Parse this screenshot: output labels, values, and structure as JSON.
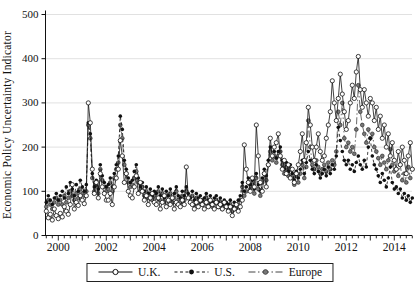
{
  "figure": {
    "background_color": "#ffffff",
    "text_color": "#111111",
    "grid_color": "#d9d9d9",
    "axis_color": "#111111"
  },
  "chart_data": {
    "type": "line",
    "title": "",
    "xlabel": "",
    "ylabel": "Economic Policy Uncertainty Indicator",
    "ylim": [
      0,
      500
    ],
    "yticks": [
      0,
      100,
      200,
      300,
      400,
      500
    ],
    "xticks": [
      2000,
      2002,
      2004,
      2006,
      2008,
      2010,
      2012,
      2014
    ],
    "x_minor_tick_interval_years": 0.25,
    "x_start": 1999.5,
    "x_step_years": 0.0833,
    "xlim": [
      1999.4,
      2014.85
    ],
    "grid": "horizontal",
    "legend_position": "bottom-center",
    "frequency": "monthly",
    "series": [
      {
        "name": "U.K.",
        "line": "solid",
        "marker": "open-circle",
        "color": "#111111",
        "values": [
          55,
          40,
          48,
          35,
          60,
          45,
          38,
          50,
          42,
          65,
          55,
          48,
          70,
          115,
          60,
          75,
          68,
          90,
          80,
          72,
          90,
          300,
          255,
          150,
          95,
          120,
          85,
          140,
          110,
          95,
          80,
          80,
          95,
          70,
          110,
          130,
          150,
          215,
          180,
          120,
          140,
          100,
          90,
          85,
          110,
          135,
          95,
          120,
          100,
          80,
          90,
          70,
          85,
          95,
          75,
          70,
          85,
          60,
          75,
          90,
          65,
          80,
          70,
          85,
          60,
          75,
          70,
          65,
          80,
          70,
          155,
          85,
          75,
          70,
          60,
          75,
          65,
          80,
          70,
          60,
          75,
          65,
          80,
          70,
          60,
          75,
          65,
          70,
          60,
          75,
          65,
          55,
          65,
          45,
          60,
          70,
          55,
          65,
          80,
          205,
          150,
          120,
          100,
          130,
          110,
          250,
          180,
          120,
          100,
          140,
          110,
          160,
          220,
          180,
          200,
          210,
          230,
          180,
          150,
          170,
          140,
          160,
          130,
          150,
          120,
          140,
          160,
          190,
          230,
          170,
          210,
          290,
          250,
          200,
          170,
          200,
          230,
          190,
          170,
          180,
          220,
          250,
          280,
          350,
          300,
          260,
          310,
          365,
          320,
          280,
          240,
          260,
          300,
          340,
          310,
          370,
          405,
          330,
          290,
          330,
          300,
          270,
          310,
          300,
          260,
          290,
          240,
          270,
          220,
          250,
          200,
          230,
          180,
          210,
          170,
          150,
          190,
          160,
          200,
          170,
          140,
          180,
          210,
          150
        ]
      },
      {
        "name": "U.S.",
        "line": "dashed",
        "marker": "filled-circle",
        "color": "#111111",
        "values": [
          75,
          90,
          80,
          70,
          85,
          95,
          80,
          90,
          100,
          85,
          110,
          95,
          120,
          105,
          90,
          115,
          100,
          125,
          110,
          100,
          115,
          255,
          230,
          140,
          110,
          125,
          105,
          160,
          135,
          120,
          110,
          115,
          130,
          110,
          140,
          160,
          180,
          270,
          240,
          170,
          150,
          130,
          120,
          125,
          145,
          160,
          130,
          110,
          120,
          100,
          110,
          95,
          105,
          90,
          100,
          95,
          110,
          90,
          105,
          85,
          100,
          90,
          105,
          85,
          95,
          110,
          90,
          85,
          100,
          90,
          110,
          95,
          85,
          100,
          80,
          95,
          85,
          90,
          80,
          85,
          95,
          80,
          90,
          75,
          85,
          90,
          75,
          85,
          70,
          80,
          75,
          70,
          80,
          65,
          75,
          70,
          80,
          90,
          120,
          100,
          110,
          130,
          115,
          125,
          105,
          140,
          115,
          100,
          130,
          150,
          135,
          170,
          200,
          180,
          190,
          175,
          190,
          200,
          170,
          150,
          165,
          145,
          160,
          140,
          125,
          145,
          130,
          150,
          170,
          140,
          165,
          190,
          170,
          150,
          140,
          160,
          145,
          130,
          140,
          150,
          135,
          155,
          140,
          160,
          150,
          180,
          245,
          215,
          190,
          170,
          160,
          170,
          150,
          160,
          145,
          165,
          180,
          160,
          150,
          170,
          155,
          200,
          220,
          180,
          160,
          150,
          135,
          120,
          140,
          125,
          110,
          130,
          155,
          120,
          105,
          110,
          95,
          105,
          85,
          95,
          80,
          90,
          75,
          85
        ]
      },
      {
        "name": "Europe",
        "line": "dash-dot",
        "marker": "gray-circle",
        "color": "#444444",
        "values": [
          65,
          80,
          70,
          60,
          75,
          85,
          70,
          80,
          70,
          90,
          75,
          85,
          100,
          90,
          80,
          95,
          85,
          105,
          95,
          90,
          100,
          250,
          220,
          130,
          100,
          115,
          95,
          150,
          125,
          110,
          100,
          105,
          120,
          100,
          130,
          150,
          165,
          250,
          220,
          160,
          140,
          120,
          110,
          115,
          130,
          145,
          120,
          100,
          110,
          90,
          100,
          85,
          95,
          80,
          90,
          85,
          100,
          80,
          95,
          75,
          90,
          80,
          95,
          75,
          85,
          100,
          80,
          75,
          90,
          80,
          100,
          85,
          75,
          90,
          70,
          85,
          75,
          80,
          70,
          75,
          85,
          70,
          80,
          65,
          75,
          80,
          65,
          75,
          60,
          70,
          65,
          60,
          70,
          55,
          65,
          60,
          70,
          80,
          110,
          90,
          100,
          120,
          105,
          115,
          95,
          130,
          105,
          90,
          120,
          140,
          125,
          160,
          190,
          170,
          180,
          165,
          180,
          190,
          160,
          140,
          155,
          135,
          150,
          130,
          115,
          135,
          120,
          140,
          160,
          130,
          155,
          260,
          200,
          160,
          150,
          170,
          155,
          140,
          150,
          160,
          145,
          165,
          150,
          170,
          160,
          190,
          280,
          250,
          300,
          220,
          200,
          210,
          190,
          200,
          185,
          240,
          340,
          280,
          250,
          230,
          210,
          240,
          220,
          230,
          200,
          190,
          175,
          160,
          180,
          165,
          150,
          170,
          195,
          160,
          145,
          150,
          135,
          160,
          125,
          140,
          120,
          155,
          130,
          150
        ]
      }
    ]
  }
}
